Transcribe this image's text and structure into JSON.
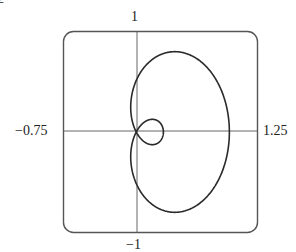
{
  "chart_data": {
    "type": "line",
    "subtype": "parametric-polar-curve",
    "title": "",
    "xlabel": "",
    "ylabel": "",
    "xlim": [
      -0.75,
      1.25
    ],
    "ylim": [
      -1,
      1
    ],
    "grid": false,
    "legend": null,
    "frame": "rounded-rectangle",
    "axes_through_origin": true,
    "tick_labels": {
      "top": "1",
      "bottom": "−1",
      "left": "−0.75",
      "right": "1.25"
    },
    "series": [
      {
        "name": "curve",
        "description": "Closed heart-shaped polar curve with a small inner loop on the left near the x-axis",
        "key_points": {
          "rightmost": [
            0.97,
            0.0
          ],
          "top": [
            0.25,
            0.79
          ],
          "bottom": [
            0.25,
            -0.79
          ],
          "leftmost_outer": [
            -0.34,
            0.0
          ],
          "self_intersection": [
            -0.26,
            0.0
          ],
          "inner_loop_right": [
            -0.02,
            0.0
          ]
        }
      }
    ]
  },
  "labels": {
    "top": "1",
    "bottom": "−1",
    "left": "−0.75",
    "right": "1.25",
    "corner_fragment": "2"
  },
  "colors": {
    "curve": "#2a2a2a",
    "axes": "#555555",
    "frame": "#555555",
    "background": "#ffffff"
  }
}
